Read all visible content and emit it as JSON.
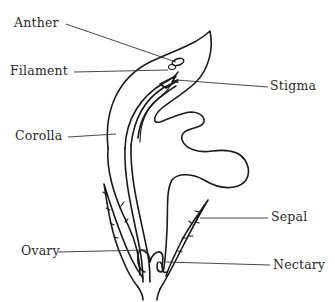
{
  "diagram": {
    "type": "labeled-botanical-illustration",
    "labels": [
      {
        "id": "anther",
        "text": "Anther"
      },
      {
        "id": "filament",
        "text": "Filament"
      },
      {
        "id": "stigma",
        "text": "Stigma"
      },
      {
        "id": "corolla",
        "text": "Corolla"
      },
      {
        "id": "sepal",
        "text": "Sepal"
      },
      {
        "id": "ovary",
        "text": "Ovary"
      },
      {
        "id": "nectary",
        "text": "Nectary"
      }
    ],
    "colors": {
      "ink": "#1a1a1a",
      "text": "#2a2a2a",
      "background": "#ffffff"
    }
  }
}
